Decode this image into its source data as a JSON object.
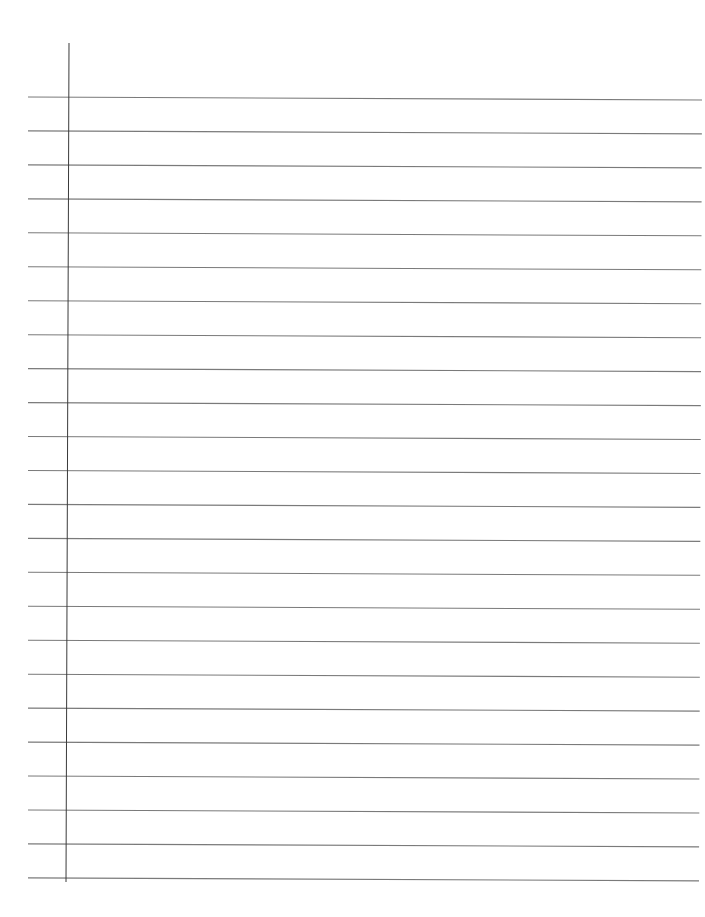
{
  "page": {
    "type": "lined-paper",
    "background_color": "#ffffff",
    "rule_color": "#7a7a7a",
    "margin_color": "#3a3a3a",
    "text": ""
  },
  "margin_line": {
    "x_top": 69,
    "y_top": 43,
    "x_bottom": 66,
    "y_bottom": 882
  },
  "ruled_lines": {
    "count": 24,
    "x_start": 28,
    "x_end_top": 702,
    "x_end_bottom": 699,
    "left_y_first": 97,
    "spacing": 33.95,
    "right_offset": 3
  }
}
